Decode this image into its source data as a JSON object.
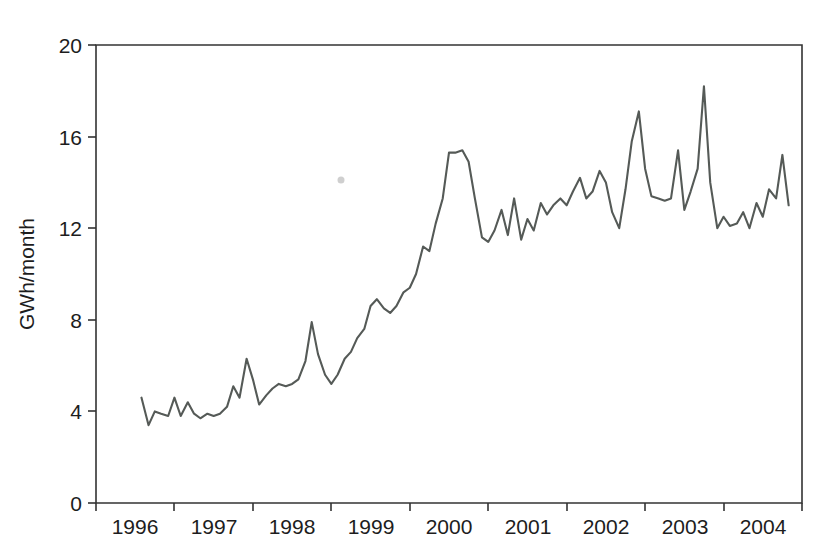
{
  "chart_data": {
    "type": "line",
    "title": "",
    "subtitle": "",
    "xlabel": "",
    "ylabel": "GWh/month",
    "xlim": [
      1996.0,
      2005.0
    ],
    "ylim": [
      0,
      20
    ],
    "grid": false,
    "legend": null,
    "y_ticks": [
      0,
      4,
      8,
      12,
      16,
      20
    ],
    "y_tick_labels": [
      "0",
      "4",
      "8",
      "12",
      "16",
      "20"
    ],
    "x_tick_positions": [
      1996,
      1997,
      1998,
      1999,
      2000,
      2001,
      2002,
      2003,
      2004,
      2005
    ],
    "x_tick_labels": [
      "1996",
      "1997",
      "1998",
      "1999",
      "2000",
      "2001",
      "2002",
      "2003",
      "2004"
    ],
    "x_label_placement": "between-ticks",
    "series": [
      {
        "name": "GWh/month",
        "color": "#555a57",
        "x_start": 1996.58,
        "x_step": 0.0833,
        "x": [
          1996.58,
          1996.67,
          1996.75,
          1996.83,
          1996.92,
          1997.0,
          1997.08,
          1997.17,
          1997.25,
          1997.33,
          1997.42,
          1997.5,
          1997.58,
          1997.67,
          1997.75,
          1997.83,
          1997.92,
          1998.0,
          1998.08,
          1998.17,
          1998.25,
          1998.33,
          1998.42,
          1998.5,
          1998.58,
          1998.67,
          1998.75,
          1998.83,
          1998.92,
          1999.0,
          1999.08,
          1999.17,
          1999.25,
          1999.33,
          1999.42,
          1999.5,
          1999.58,
          1999.67,
          1999.75,
          1999.83,
          1999.92,
          2000.0,
          2000.08,
          2000.17,
          2000.25,
          2000.33,
          2000.42,
          2000.5,
          2000.58,
          2000.67,
          2000.75,
          2000.83,
          2000.92,
          2001.0,
          2001.08,
          2001.17,
          2001.25,
          2001.33,
          2001.42,
          2001.5,
          2001.58,
          2001.67,
          2001.75,
          2001.83,
          2001.92,
          2002.0,
          2002.08,
          2002.17,
          2002.25,
          2002.33,
          2002.42,
          2002.5,
          2002.58,
          2002.67,
          2002.75,
          2002.83,
          2002.92,
          2003.0,
          2003.08,
          2003.17,
          2003.25,
          2003.33,
          2003.42,
          2003.5,
          2003.58,
          2003.67,
          2003.75,
          2003.83,
          2003.92,
          2004.0,
          2004.08,
          2004.17,
          2004.25,
          2004.33,
          2004.42,
          2004.5,
          2004.58,
          2004.67,
          2004.75,
          2004.83
        ],
        "values": [
          4.6,
          3.4,
          4.0,
          3.9,
          3.8,
          4.6,
          3.8,
          4.4,
          3.9,
          3.7,
          3.9,
          3.8,
          3.9,
          4.2,
          5.1,
          4.6,
          6.3,
          5.4,
          4.3,
          4.7,
          5.0,
          5.2,
          5.1,
          5.2,
          5.4,
          6.2,
          7.9,
          6.5,
          5.6,
          5.2,
          5.6,
          6.3,
          6.6,
          7.2,
          7.6,
          8.6,
          8.9,
          8.5,
          8.3,
          8.6,
          9.2,
          9.4,
          10.0,
          11.2,
          11.0,
          12.2,
          13.3,
          15.3,
          15.3,
          15.4,
          14.9,
          13.3,
          11.6,
          11.4,
          11.9,
          12.8,
          11.7,
          13.3,
          11.5,
          12.4,
          11.9,
          13.1,
          12.6,
          13.0,
          13.3,
          13.0,
          13.6,
          14.2,
          13.3,
          13.6,
          14.5,
          14.0,
          12.7,
          12.0,
          13.7,
          15.8,
          17.1,
          14.6,
          13.4,
          13.3,
          13.2,
          13.3,
          15.4,
          12.8,
          13.6,
          14.6,
          18.2,
          14.0,
          12.0,
          12.5,
          12.1,
          12.2,
          12.7,
          12.0,
          13.1,
          12.5,
          13.7,
          13.3,
          15.2,
          13.0
        ]
      }
    ],
    "annotations": [
      {
        "name": "scan-speck",
        "x_px": 341,
        "y_px": 180
      }
    ]
  },
  "axes": {
    "y_axis_label": "GWh/month"
  }
}
